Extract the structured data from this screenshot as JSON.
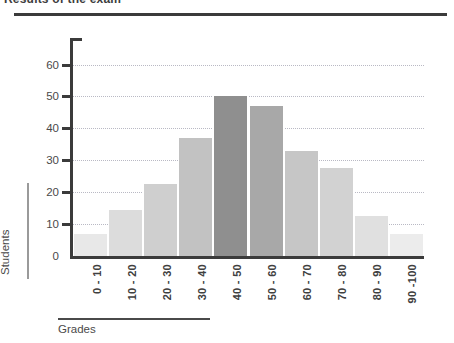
{
  "title": "Results of the exam",
  "axis_titles": {
    "y": "Students",
    "x": "Grades"
  },
  "chart_data": {
    "type": "bar",
    "title": "Results of the exam",
    "xlabel": "Grades",
    "ylabel": "Students",
    "categories": [
      "0 - 10",
      "10 - 20",
      "20 - 30",
      "30 - 40",
      "40 - 50",
      "50 - 60",
      "60 - 70",
      "70 - 80",
      "80 - 90",
      "90 -100"
    ],
    "values": [
      7,
      14.5,
      22.5,
      37,
      50,
      47,
      33,
      27.5,
      12.5,
      7
    ],
    "ylim": [
      0,
      68
    ],
    "yticks": [
      0,
      10,
      20,
      30,
      40,
      50,
      60
    ],
    "ytick_labels": [
      "0",
      "10",
      "20",
      "30",
      "40",
      "50",
      "60"
    ],
    "grid": true,
    "legend": false,
    "bar_colors": [
      "#e8e8e8",
      "#dcdcdc",
      "#cfcfcf",
      "#c2c2c2",
      "#8f8f8f",
      "#a8a8a8",
      "#c6c6c6",
      "#d2d2d2",
      "#e0e0e0",
      "#ececec"
    ]
  },
  "colors": {
    "axis": "#3b3b3b",
    "grid": "#b9b9c4",
    "text": "#4a4a4a"
  }
}
